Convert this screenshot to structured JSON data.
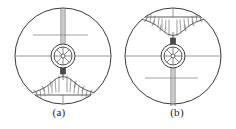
{
  "figure": {
    "kind": "engineering-line-drawing",
    "background_color": "#ffffff",
    "line_color": "#3a3a3a",
    "thin_line_color": "#8d8d8d",
    "hatch_color": "#6b6b6b",
    "block_color": "#4a4a4a",
    "width_px": 236,
    "height_px": 129
  },
  "panels": [
    {
      "id": "a",
      "caption": "(a)",
      "orientation": "material-mound-at-bottom",
      "vessel": {
        "label": "outer-circle",
        "center_x": 63,
        "center_y": 56,
        "radius": 48
      },
      "hub": {
        "label": "spoked-hub",
        "outer_radius": 12,
        "inner_radius": 9,
        "core_radius": 2,
        "spoke_count": 8
      },
      "shaft": {
        "label": "twin-line-shaft",
        "direction": "up",
        "line_gap_px": 4
      },
      "connector_block": {
        "label": "nozzle-block",
        "direction": "down",
        "width_px": 5,
        "height_px": 9
      },
      "mound": {
        "label": "hatched-material-heap",
        "position": "bottom",
        "hatching": "radial-short-strokes"
      },
      "center_lines": [
        "horizontal-full-width-centerline",
        "vertical-full-height-centerline",
        "short-auxiliary-horizontal-line-above-hub"
      ]
    },
    {
      "id": "b",
      "caption": "(b)",
      "orientation": "material-mound-at-top",
      "vessel": {
        "label": "outer-circle",
        "center_x": 63,
        "center_y": 56,
        "radius": 48
      },
      "hub": {
        "label": "spoked-hub",
        "outer_radius": 12,
        "inner_radius": 9,
        "core_radius": 2,
        "spoke_count": 8
      },
      "shaft": {
        "label": "twin-line-shaft",
        "direction": "down",
        "line_gap_px": 4
      },
      "connector_block": {
        "label": "nozzle-block",
        "direction": "up",
        "width_px": 5,
        "height_px": 9
      },
      "mound": {
        "label": "hatched-material-heap",
        "position": "top",
        "hatching": "radial-short-strokes"
      },
      "center_lines": [
        "horizontal-full-width-centerline",
        "vertical-full-height-centerline",
        "short-auxiliary-horizontal-line-below-hub"
      ]
    }
  ]
}
